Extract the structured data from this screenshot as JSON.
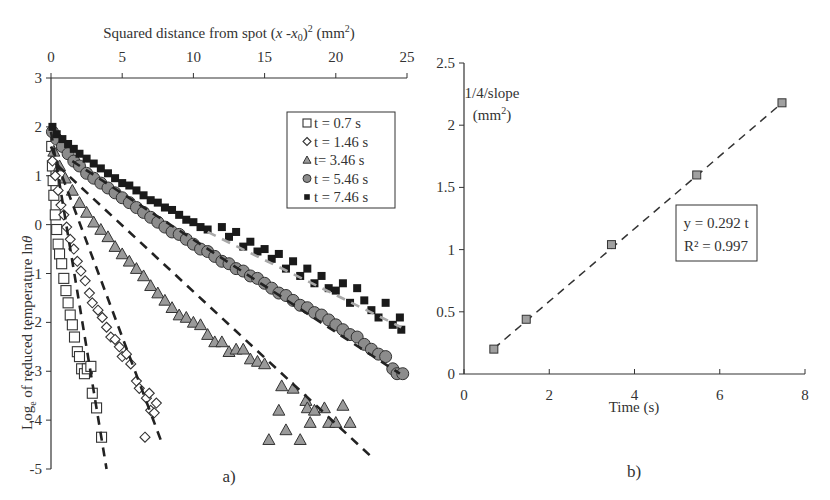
{
  "chart_data": [
    {
      "type": "scatter",
      "panel_label": "a)",
      "title": "",
      "xlabel": "Squared distance from spot (x -x0)^2 (mm^2)",
      "xlabel_parts": {
        "main": "Squared distance from spot (",
        "x": "x",
        "mid": " -",
        "x0": "x",
        "sub0": "0",
        "close": ")",
        "sup": "2",
        "unit_open": " (mm",
        "unit_sup": "2",
        "unit_close": ")"
      },
      "ylabel": "Log of reduced temperature ln θ",
      "ylabel_parts": {
        "pre": "Log",
        "sub": "e",
        "post": " of reduced temperature  ln",
        "theta": "θ"
      },
      "xaxis_position": "top",
      "xlim": [
        0,
        25
      ],
      "ylim": [
        -5,
        3
      ],
      "xticks": [
        "0",
        "5",
        "10",
        "15",
        "20",
        "25"
      ],
      "yticks": [
        "3",
        "2",
        "1",
        "0",
        "-1",
        "-2",
        "-3",
        "-4",
        "-5"
      ],
      "grid": false,
      "legend_position": "upper right",
      "series": [
        {
          "name": "t = 0.7 s",
          "marker": "square-open",
          "color": "#333333",
          "points": [
            [
              0.05,
              1.6
            ],
            [
              0.1,
              1.2
            ],
            [
              0.15,
              0.9
            ],
            [
              0.2,
              0.6
            ],
            [
              0.3,
              0.2
            ],
            [
              0.4,
              -0.1
            ],
            [
              0.5,
              -0.4
            ],
            [
              0.6,
              -0.6
            ],
            [
              0.75,
              -0.8
            ],
            [
              0.9,
              -1.1
            ],
            [
              1.05,
              -1.35
            ],
            [
              1.2,
              -1.6
            ],
            [
              1.35,
              -1.85
            ],
            [
              1.5,
              -2.05
            ],
            [
              1.65,
              -2.3
            ],
            [
              1.85,
              -2.6
            ],
            [
              2.0,
              -2.7
            ],
            [
              2.15,
              -2.95
            ],
            [
              2.35,
              -3.05
            ],
            [
              2.55,
              -2.95
            ],
            [
              2.8,
              -2.9
            ],
            [
              2.9,
              -3.45
            ],
            [
              3.2,
              -3.75
            ],
            [
              3.55,
              -4.35
            ]
          ],
          "fit": {
            "style": "dashed",
            "color": "#222222",
            "from": [
              0,
              1.9
            ],
            "to": [
              3.9,
              -5.0
            ]
          }
        },
        {
          "name": "t = 1.46 s",
          "marker": "diamond-open",
          "color": "#333333",
          "points": [
            [
              0.1,
              1.3
            ],
            [
              0.3,
              1.0
            ],
            [
              0.5,
              0.7
            ],
            [
              0.7,
              0.4
            ],
            [
              0.9,
              0.2
            ],
            [
              1.1,
              -0.05
            ],
            [
              1.35,
              -0.3
            ],
            [
              1.6,
              -0.5
            ],
            [
              1.85,
              -0.75
            ],
            [
              2.1,
              -0.95
            ],
            [
              2.4,
              -1.15
            ],
            [
              2.7,
              -1.4
            ],
            [
              2.9,
              -1.6
            ],
            [
              3.3,
              -1.75
            ],
            [
              3.6,
              -1.9
            ],
            [
              3.9,
              -2.1
            ],
            [
              4.2,
              -2.3
            ],
            [
              4.5,
              -2.35
            ],
            [
              4.8,
              -2.5
            ],
            [
              5.0,
              -2.7
            ],
            [
              5.3,
              -2.65
            ],
            [
              5.6,
              -2.85
            ],
            [
              6.0,
              -3.2
            ],
            [
              6.2,
              -3.35
            ],
            [
              6.7,
              -3.55
            ],
            [
              6.9,
              -3.45
            ],
            [
              7.0,
              -3.8
            ],
            [
              7.25,
              -3.85
            ],
            [
              7.4,
              -3.65
            ],
            [
              6.6,
              -4.35
            ]
          ],
          "fit": {
            "style": "dashed",
            "color": "#222222",
            "from": [
              0,
              1.6
            ],
            "to": [
              7.7,
              -4.4
            ]
          }
        },
        {
          "name": "t= 3.46 s",
          "marker": "triangle",
          "color": "#9a9a9a",
          "points": [
            [
              0.2,
              1.5
            ],
            [
              0.6,
              1.2
            ],
            [
              1.0,
              0.95
            ],
            [
              1.5,
              0.7
            ],
            [
              2.0,
              0.45
            ],
            [
              2.5,
              0.25
            ],
            [
              3.0,
              0.05
            ],
            [
              3.5,
              -0.1
            ],
            [
              4.0,
              -0.25
            ],
            [
              4.5,
              -0.45
            ],
            [
              5.0,
              -0.6
            ],
            [
              5.5,
              -0.75
            ],
            [
              6.0,
              -0.9
            ],
            [
              6.5,
              -1.05
            ],
            [
              7.0,
              -1.25
            ],
            [
              7.5,
              -1.4
            ],
            [
              8.0,
              -1.55
            ],
            [
              8.5,
              -1.7
            ],
            [
              9.0,
              -1.85
            ],
            [
              9.5,
              -1.9
            ],
            [
              10.0,
              -2.0
            ],
            [
              10.5,
              -2.05
            ],
            [
              11.0,
              -2.25
            ],
            [
              11.5,
              -2.4
            ],
            [
              12.0,
              -2.4
            ],
            [
              12.5,
              -2.6
            ],
            [
              13.0,
              -2.55
            ],
            [
              13.5,
              -2.55
            ],
            [
              14.0,
              -2.75
            ],
            [
              14.5,
              -2.8
            ],
            [
              15.0,
              -2.85
            ],
            [
              16.2,
              -3.3
            ],
            [
              17.0,
              -3.35
            ],
            [
              17.9,
              -3.6
            ],
            [
              18.0,
              -3.75
            ],
            [
              16.5,
              -4.2
            ],
            [
              16.0,
              -3.8
            ],
            [
              18.5,
              -3.8
            ],
            [
              19.2,
              -3.75
            ],
            [
              19.5,
              -4.05
            ],
            [
              20.0,
              -4.05
            ],
            [
              20.5,
              -3.7
            ],
            [
              21.0,
              -4.05
            ],
            [
              18.2,
              -4.05
            ],
            [
              15.3,
              -4.4
            ],
            [
              17.5,
              -4.4
            ]
          ],
          "fit": {
            "style": "dashed",
            "color": "#222222",
            "from": [
              0.5,
              1.2
            ],
            "to": [
              22.5,
              -4.75
            ]
          }
        },
        {
          "name": "t = 5.46 s",
          "marker": "circle",
          "color": "#8c8c8c",
          "points": [
            [
              0.1,
              1.9
            ],
            [
              0.4,
              1.75
            ],
            [
              0.8,
              1.6
            ],
            [
              1.2,
              1.45
            ],
            [
              1.6,
              1.3
            ],
            [
              2.0,
              1.2
            ],
            [
              2.5,
              1.05
            ],
            [
              3.0,
              0.95
            ],
            [
              3.5,
              0.85
            ],
            [
              4.0,
              0.75
            ],
            [
              4.5,
              0.65
            ],
            [
              5.0,
              0.55
            ],
            [
              5.5,
              0.45
            ],
            [
              6.0,
              0.35
            ],
            [
              6.5,
              0.25
            ],
            [
              7.0,
              0.15
            ],
            [
              7.5,
              0.05
            ],
            [
              8.0,
              -0.05
            ],
            [
              8.5,
              -0.15
            ],
            [
              9.0,
              -0.2
            ],
            [
              9.5,
              -0.3
            ],
            [
              10.0,
              -0.4
            ],
            [
              10.5,
              -0.5
            ],
            [
              11.0,
              -0.55
            ],
            [
              11.5,
              -0.65
            ],
            [
              12.0,
              -0.75
            ],
            [
              12.5,
              -0.8
            ],
            [
              13.0,
              -0.9
            ],
            [
              13.5,
              -0.95
            ],
            [
              14.0,
              -1.05
            ],
            [
              14.5,
              -1.1
            ],
            [
              15.0,
              -1.2
            ],
            [
              15.5,
              -1.3
            ],
            [
              16.0,
              -1.4
            ],
            [
              16.5,
              -1.45
            ],
            [
              17.0,
              -1.55
            ],
            [
              17.5,
              -1.65
            ],
            [
              18.0,
              -1.7
            ],
            [
              18.5,
              -1.8
            ],
            [
              19.0,
              -1.85
            ],
            [
              19.5,
              -1.95
            ],
            [
              20.0,
              -2.05
            ],
            [
              20.5,
              -2.15
            ],
            [
              21.0,
              -2.25
            ],
            [
              21.5,
              -2.3
            ],
            [
              22.0,
              -2.45
            ],
            [
              22.5,
              -2.55
            ],
            [
              23.0,
              -2.65
            ],
            [
              23.5,
              -2.7
            ],
            [
              24.0,
              -2.95
            ],
            [
              24.3,
              -3.05
            ],
            [
              24.7,
              -3.05
            ]
          ],
          "fit": {
            "style": "dashed",
            "color": "#222222",
            "from": [
              1.5,
              1.3
            ],
            "to": [
              24.5,
              -3.05
            ]
          }
        },
        {
          "name": "t = 7.46 s",
          "marker": "square-filled",
          "color": "#1a1a1a",
          "points": [
            [
              0.1,
              2.0
            ],
            [
              0.4,
              1.85
            ],
            [
              0.8,
              1.75
            ],
            [
              1.2,
              1.65
            ],
            [
              1.6,
              1.55
            ],
            [
              2.0,
              1.45
            ],
            [
              2.5,
              1.35
            ],
            [
              3.0,
              1.25
            ],
            [
              3.5,
              1.15
            ],
            [
              4.0,
              1.05
            ],
            [
              4.5,
              0.95
            ],
            [
              5.0,
              0.85
            ],
            [
              5.5,
              0.8
            ],
            [
              6.0,
              0.7
            ],
            [
              6.5,
              0.6
            ],
            [
              7.0,
              0.5
            ],
            [
              7.5,
              0.45
            ],
            [
              8.0,
              0.35
            ],
            [
              8.5,
              0.3
            ],
            [
              9.0,
              0.2
            ],
            [
              9.5,
              0.1
            ],
            [
              10.0,
              0.05
            ],
            [
              10.5,
              -0.05
            ],
            [
              11.0,
              -0.1
            ],
            [
              12.0,
              -0.05
            ],
            [
              12.5,
              -0.25
            ],
            [
              13.0,
              -0.15
            ],
            [
              13.5,
              -0.45
            ],
            [
              14.0,
              -0.35
            ],
            [
              14.5,
              -0.55
            ],
            [
              15.0,
              -0.5
            ],
            [
              15.5,
              -0.7
            ],
            [
              16.0,
              -0.6
            ],
            [
              16.5,
              -0.9
            ],
            [
              17.0,
              -0.75
            ],
            [
              17.5,
              -1.05
            ],
            [
              18.0,
              -0.9
            ],
            [
              18.5,
              -1.2
            ],
            [
              19.0,
              -1.05
            ],
            [
              19.5,
              -1.3
            ],
            [
              20.0,
              -1.35
            ],
            [
              20.5,
              -1.2
            ],
            [
              21.0,
              -1.6
            ],
            [
              21.5,
              -1.3
            ],
            [
              22.0,
              -1.55
            ],
            [
              22.5,
              -1.75
            ],
            [
              23.0,
              -1.9
            ],
            [
              23.5,
              -1.6
            ],
            [
              24.0,
              -2.05
            ],
            [
              24.5,
              -1.9
            ],
            [
              24.6,
              -2.15
            ]
          ],
          "fit": {
            "style": "dashed",
            "color": "#a8a8a8",
            "from": [
              11.0,
              -0.15
            ],
            "to": [
              24.6,
              -2.1
            ]
          }
        }
      ]
    },
    {
      "type": "scatter",
      "panel_label": "b)",
      "title": "",
      "xlabel": "Time (s)",
      "ylabel": "1/4/slope (mm^2)",
      "ylabel_parts": {
        "line1": "1/4/slope",
        "line2_open": "(mm",
        "line2_sup": "2",
        "line2_close": ")"
      },
      "xlim": [
        0,
        8
      ],
      "ylim": [
        0,
        2.5
      ],
      "xticks": [
        "0",
        "2",
        "4",
        "6",
        "8"
      ],
      "yticks": [
        "0",
        "0.5",
        "1",
        "1.5",
        "2",
        "2.5"
      ],
      "grid": false,
      "series": [
        {
          "name": "1/4/slope",
          "marker": "square-gray",
          "color": "#a0a0a0",
          "x": [
            0.7,
            1.46,
            3.46,
            5.46,
            7.46
          ],
          "y": [
            0.2,
            0.44,
            1.04,
            1.6,
            2.18
          ]
        }
      ],
      "fit": {
        "style": "dashed",
        "equation": "y = 0.292 t",
        "r2": "R² = 0.997",
        "slope": 0.292,
        "from_x": 0.7,
        "to_x": 7.46
      }
    }
  ]
}
